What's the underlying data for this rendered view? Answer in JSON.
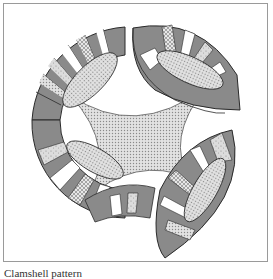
{
  "figure": {
    "caption": "Clamshell pattern",
    "colors": {
      "dark": "#7a7a7a",
      "outline": "#2a2a2a",
      "light": "#ffffff",
      "center": "#c8c8c8",
      "frame": "#9a9a9a"
    },
    "arcs": [
      {
        "name": "top-left-arc"
      },
      {
        "name": "top-right-arc"
      },
      {
        "name": "bottom-left-arc"
      },
      {
        "name": "bottom-right-arc"
      }
    ]
  }
}
